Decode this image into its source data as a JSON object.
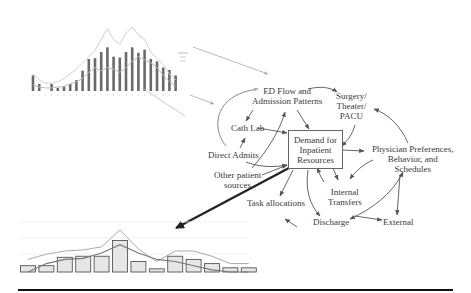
{
  "diagram": {
    "central_node": {
      "line1": "Demand for",
      "line2": "Inpatient",
      "line3": "Resources"
    },
    "nodes": {
      "ed_flow": {
        "line1": "ED Flow and",
        "line2": "Admission Patterns"
      },
      "surgery": {
        "line1": "Surgery/",
        "line2": "Theater/",
        "line3": "PACU"
      },
      "cath_lab": {
        "line1": "Cath Lab"
      },
      "direct_admits": {
        "line1": "Direct Admits"
      },
      "other_sources": {
        "line1": "Other patient",
        "line2": "sources"
      },
      "physician": {
        "line1": "Physician Preferences,",
        "line2": "Behavior, and",
        "line3": "Schedules"
      },
      "internal_transfers": {
        "line1": "Internal",
        "line2": "Transfers"
      },
      "task_allocations": {
        "line1": "Task allocations"
      },
      "discharge": {
        "line1": "Discharge"
      },
      "external": {
        "line1": "External"
      }
    },
    "colors": {
      "arrow": "#555555",
      "bold_arrow": "#222222",
      "chart_bar": "#666666",
      "chart_line": "#bbbbbb"
    }
  },
  "chart_data": [
    {
      "type": "bar",
      "title": "",
      "xlabel": "",
      "ylabel": "",
      "categories": [
        "1",
        "2",
        "3",
        "4",
        "5",
        "6",
        "7",
        "8",
        "9",
        "10",
        "11",
        "12",
        "13",
        "14",
        "15",
        "16",
        "17",
        "18",
        "19",
        "20",
        "21",
        "22",
        "23",
        "24"
      ],
      "series": [
        {
          "name": "bars",
          "values": [
            20,
            9,
            0,
            9,
            4,
            6,
            9,
            14,
            26,
            41,
            42,
            50,
            56,
            44,
            43,
            50,
            56,
            49,
            53,
            41,
            38,
            30,
            27,
            20
          ]
        },
        {
          "name": "line-upper",
          "values": [
            22,
            14,
            10,
            10,
            12,
            16,
            22,
            28,
            36,
            44,
            52,
            66,
            80,
            66,
            60,
            74,
            82,
            72,
            66,
            50,
            42,
            34,
            22,
            14
          ]
        },
        {
          "name": "line-lower",
          "values": [
            8,
            5,
            4,
            4,
            5,
            6,
            9,
            12,
            16,
            24,
            30,
            26,
            30,
            28,
            24,
            30,
            38,
            44,
            40,
            36,
            30,
            20,
            12,
            6
          ]
        }
      ],
      "grid": false,
      "legend": {
        "position": "right",
        "entries": [
          "",
          "",
          ""
        ]
      }
    },
    {
      "type": "bar",
      "title": "",
      "xlabel": "",
      "ylabel": "",
      "categories": [
        "1",
        "2",
        "3",
        "4",
        "5",
        "6",
        "7",
        "8",
        "9",
        "10",
        "11",
        "12",
        "13"
      ],
      "series": [
        {
          "name": "bars",
          "values": [
            6,
            6,
            14,
            15,
            15,
            30,
            10,
            3,
            15,
            12,
            8,
            4,
            4
          ]
        },
        {
          "name": "line-upper",
          "values": [
            12,
            17,
            20,
            21,
            24,
            40,
            22,
            10,
            20,
            20,
            15,
            8,
            8
          ]
        },
        {
          "name": "line-lower",
          "values": [
            0,
            8,
            12,
            13,
            18,
            26,
            18,
            12,
            10,
            6,
            2,
            0,
            0
          ]
        }
      ],
      "grid": true,
      "legend": null
    }
  ]
}
